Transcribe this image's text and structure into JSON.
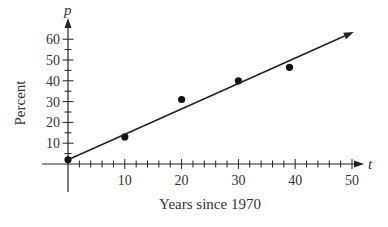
{
  "chart_data": {
    "type": "scatter",
    "title": "",
    "xlabel": "Years since 1970",
    "ylabel": "Percent",
    "x_variable": "t",
    "y_variable": "p",
    "xlim": [
      0,
      50
    ],
    "ylim": [
      0,
      60
    ],
    "x_ticks": [
      10,
      20,
      30,
      40,
      50
    ],
    "y_ticks": [
      10,
      20,
      30,
      40,
      50,
      60
    ],
    "x_minor_step": 2,
    "y_minor_step": 5,
    "grid": false,
    "series": [
      {
        "name": "data",
        "kind": "points",
        "points": [
          [
            0,
            2
          ],
          [
            10,
            13
          ],
          [
            20,
            31
          ],
          [
            30,
            40
          ],
          [
            39,
            46.5
          ]
        ]
      },
      {
        "name": "trend line",
        "kind": "line",
        "points": [
          [
            0,
            2
          ],
          [
            50.3,
            63.5
          ]
        ],
        "arrow_end": true
      }
    ]
  }
}
